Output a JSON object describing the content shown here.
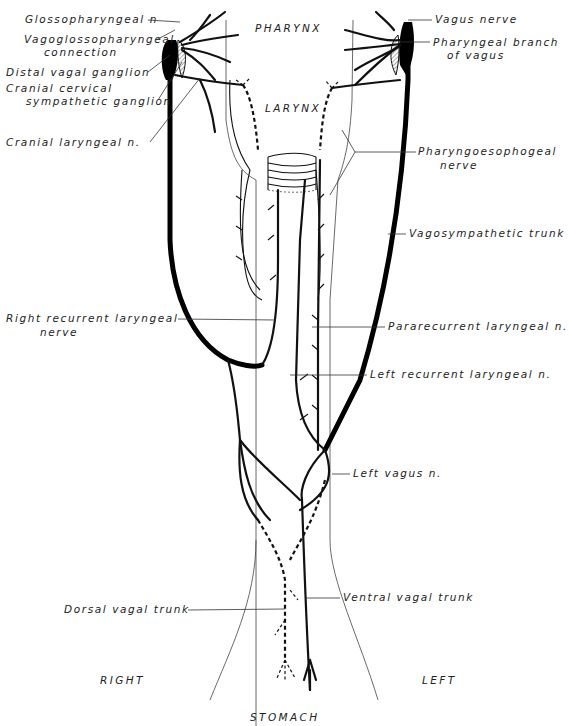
{
  "diagram": {
    "type": "anatomical-illustration",
    "regions": {
      "pharynx": "PHARYNX",
      "larynx": "LARYNX",
      "right": "RIGHT",
      "left": "LEFT",
      "stomach": "STOMACH"
    },
    "labels_left": [
      {
        "id": "glossopharyngeal",
        "text": "Glossopharyngeal n"
      },
      {
        "id": "vagoglosso-1",
        "text": "Vagoglossopharyngeal"
      },
      {
        "id": "vagoglosso-2",
        "text": "connection"
      },
      {
        "id": "distal-ganglion",
        "text": "Distal vagal ganglion"
      },
      {
        "id": "cranial-cervical-1",
        "text": "Cranial cervical"
      },
      {
        "id": "cranial-cervical-2",
        "text": "sympathetic ganglion"
      },
      {
        "id": "cranial-laryngeal",
        "text": "Cranial laryngeal n."
      },
      {
        "id": "right-recurrent-1",
        "text": "Right recurrent laryngeal"
      },
      {
        "id": "right-recurrent-2",
        "text": "nerve"
      },
      {
        "id": "dorsal-trunk",
        "text": "Dorsal vagal trunk"
      }
    ],
    "labels_right": [
      {
        "id": "vagus-nerve",
        "text": "Vagus nerve"
      },
      {
        "id": "pharyngeal-branch-1",
        "text": "Pharyngeal branch"
      },
      {
        "id": "pharyngeal-branch-2",
        "text": "of vagus"
      },
      {
        "id": "pharyngoesophageal-1",
        "text": "Pharyngoesophogeal"
      },
      {
        "id": "pharyngoesophageal-2",
        "text": "nerve"
      },
      {
        "id": "vagosympathetic",
        "text": "Vagosympathetic trunk"
      },
      {
        "id": "pararecurrent",
        "text": "Pararecurrent laryngeal n."
      },
      {
        "id": "left-recurrent",
        "text": "Left recurrent laryngeal n."
      },
      {
        "id": "left-vagus",
        "text": "Left vagus n."
      },
      {
        "id": "ventral-trunk",
        "text": "Ventral vagal trunk"
      }
    ]
  }
}
